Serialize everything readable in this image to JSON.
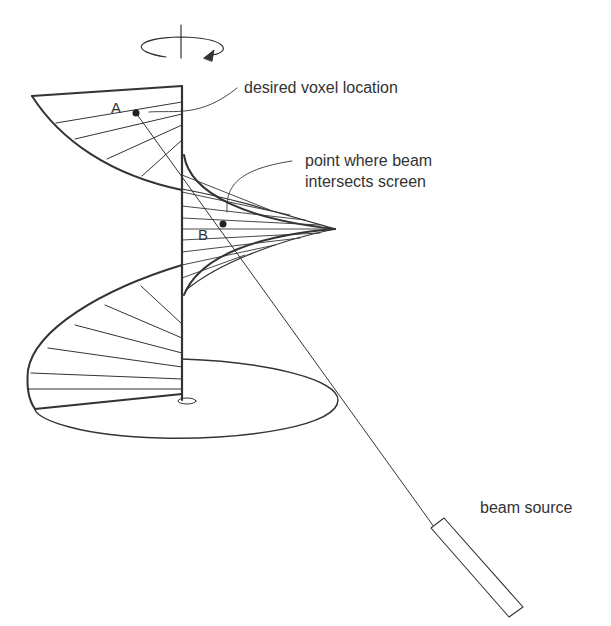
{
  "diagram": {
    "title": "",
    "labels": {
      "voxel": "desired voxel location",
      "intersect_line1": "point where beam",
      "intersect_line2": "intersects screen",
      "source": "beam source",
      "point_a": "A",
      "point_b": "B"
    },
    "elements": [
      "rotation-axis-with-arrow",
      "helical-screen",
      "floor-ellipse",
      "beam-line",
      "beam-source"
    ],
    "colors": {
      "stroke": "#333333",
      "background": "#ffffff"
    }
  }
}
